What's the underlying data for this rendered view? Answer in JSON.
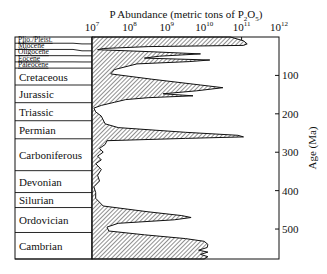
{
  "chart_data": {
    "type": "area",
    "title_parts": {
      "main": "P Abundance (metric tons of P",
      "sub1": "2",
      "mid": "O",
      "sub2": "5",
      "end": ")"
    },
    "xlabel": "P Abundance (metric tons of P2O5)",
    "ylabel": "Age (Ma)",
    "x_scale": "log",
    "xlim": [
      10000000,
      1000000000000
    ],
    "x_ticks": [
      {
        "base": "10",
        "exp": "7",
        "log": 7
      },
      {
        "base": "10",
        "exp": "8",
        "log": 8
      },
      {
        "base": "10",
        "exp": "9",
        "log": 9
      },
      {
        "base": "10",
        "exp": "10",
        "log": 10
      },
      {
        "base": "10",
        "exp": "11",
        "log": 11
      },
      {
        "base": "10",
        "exp": "12",
        "log": 12
      }
    ],
    "ylim": [
      0,
      578
    ],
    "y_ticks": [
      {
        "label": "100",
        "value": 100
      },
      {
        "label": "200",
        "value": 200
      },
      {
        "label": "300",
        "value": 300
      },
      {
        "label": "400",
        "value": 400
      },
      {
        "label": "500",
        "value": 500
      }
    ],
    "periods": [
      {
        "name": "Plio./Pleist.",
        "start": 0,
        "end": 18,
        "small": true
      },
      {
        "name": "Miocene",
        "start": 18,
        "end": 36,
        "small": true
      },
      {
        "name": "Oligocene",
        "start": 36,
        "end": 49,
        "small": true
      },
      {
        "name": "Eocene",
        "start": 49,
        "end": 65,
        "small": true
      },
      {
        "name": "Paleocene",
        "start": 65,
        "end": 81,
        "small": true
      },
      {
        "name": "Cretaceous",
        "start": 81,
        "end": 125,
        "small": false
      },
      {
        "name": "Jurassic",
        "start": 125,
        "end": 171,
        "small": false
      },
      {
        "name": "Triassic",
        "start": 171,
        "end": 218,
        "small": false
      },
      {
        "name": "Permian",
        "start": 218,
        "end": 265,
        "small": false
      },
      {
        "name": "Carboniferous",
        "start": 265,
        "end": 348,
        "small": false
      },
      {
        "name": "Devonian",
        "start": 348,
        "end": 405,
        "small": false
      },
      {
        "name": "Silurian",
        "start": 405,
        "end": 444,
        "small": false
      },
      {
        "name": "Ordovician",
        "start": 444,
        "end": 509,
        "small": false
      },
      {
        "name": "Cambrian",
        "start": 509,
        "end": 578,
        "small": false
      }
    ],
    "series": [
      {
        "name": "P abundance",
        "fill": "hatched",
        "points": [
          [
            0,
            10.7
          ],
          [
            10,
            11.05
          ],
          [
            18,
            11.15
          ],
          [
            22,
            11.05
          ],
          [
            25,
            8.5
          ],
          [
            30,
            7.3
          ],
          [
            33,
            7.15
          ],
          [
            38,
            8.5
          ],
          [
            44,
            9.9
          ],
          [
            50,
            8.8
          ],
          [
            55,
            8.4
          ],
          [
            60,
            10.15
          ],
          [
            64,
            9.6
          ],
          [
            70,
            8.2
          ],
          [
            85,
            7.6
          ],
          [
            96,
            7.5
          ],
          [
            110,
            8.6
          ],
          [
            125,
            9.9
          ],
          [
            132,
            10.5
          ],
          [
            140,
            9.8
          ],
          [
            148,
            8.9
          ],
          [
            153,
            9.7
          ],
          [
            158,
            8.5
          ],
          [
            163,
            7.9
          ],
          [
            170,
            7.6
          ],
          [
            178,
            7.25
          ],
          [
            185,
            7.05
          ],
          [
            195,
            7.1
          ],
          [
            206,
            7.25
          ],
          [
            216,
            7.3
          ],
          [
            226,
            7.35
          ],
          [
            236,
            7.7
          ],
          [
            248,
            9.5
          ],
          [
            256,
            10.9
          ],
          [
            260,
            11.05
          ],
          [
            264,
            9.5
          ],
          [
            270,
            7.4
          ],
          [
            280,
            7.35
          ],
          [
            290,
            7.2
          ],
          [
            300,
            7.3
          ],
          [
            310,
            7.15
          ],
          [
            320,
            7.25
          ],
          [
            330,
            7.1
          ],
          [
            345,
            7.25
          ],
          [
            360,
            7.15
          ],
          [
            375,
            7.2
          ],
          [
            390,
            7.05
          ],
          [
            405,
            7.1
          ],
          [
            420,
            7.1
          ],
          [
            440,
            7.3
          ],
          [
            455,
            8.5
          ],
          [
            465,
            9.4
          ],
          [
            470,
            9.65
          ],
          [
            476,
            9.2
          ],
          [
            485,
            7.7
          ],
          [
            495,
            7.4
          ],
          [
            505,
            7.45
          ],
          [
            515,
            8.4
          ],
          [
            525,
            9.5
          ],
          [
            532,
            10.0
          ],
          [
            540,
            10.1
          ],
          [
            548,
            10.08
          ],
          [
            555,
            9.85
          ],
          [
            560,
            10.1
          ],
          [
            566,
            9.9
          ],
          [
            572,
            10.1
          ],
          [
            578,
            10.0
          ]
        ]
      }
    ]
  }
}
